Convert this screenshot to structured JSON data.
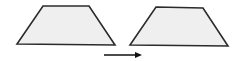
{
  "diagram": {
    "colors": {
      "stroke": "#2b2b2b",
      "fill": "#efefef",
      "arrow": "#111111"
    },
    "shapes": [
      {
        "id": "original-trapezoid",
        "points": "43,6 89,6 115,45 17,44"
      },
      {
        "id": "translated-trapezoid",
        "points": "156,7 203,8 228,46 130,45"
      }
    ],
    "arrow": {
      "x1": 104,
      "y1": 55,
      "x2": 142,
      "y2": 55,
      "direction": "right"
    }
  }
}
